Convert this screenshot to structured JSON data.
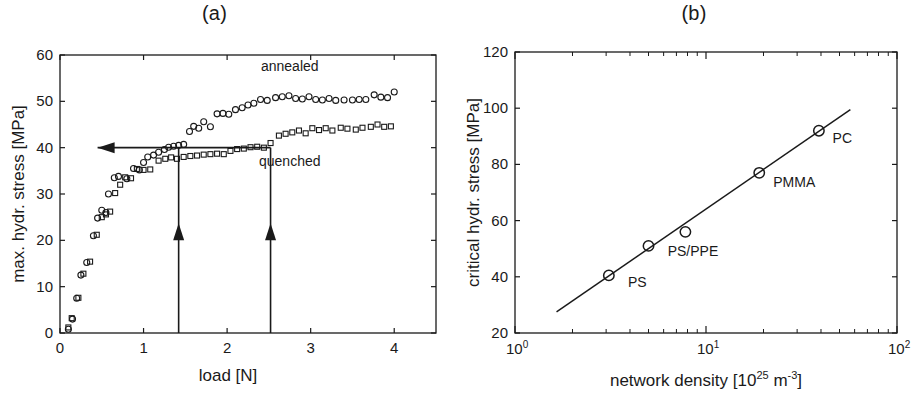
{
  "figure": {
    "background": "#ffffff",
    "ink": "#1a1a1a"
  },
  "panels": {
    "a": {
      "title": "(a)",
      "series_labels": {
        "annealed": "annealed",
        "quenched": "quenched"
      }
    },
    "b": {
      "title": "(b)"
    }
  },
  "chart_data": [
    {
      "panel": "a",
      "type": "scatter",
      "title": "(a)",
      "xlabel": "load [N]",
      "ylabel": "max. hydr. stress [MPa]",
      "xlim": [
        0,
        4.5
      ],
      "ylim": [
        0,
        60
      ],
      "xticks": [
        0,
        1,
        2,
        3,
        4
      ],
      "yticks": [
        0,
        10,
        20,
        30,
        40,
        50,
        60
      ],
      "xtick_labels": [
        "0",
        "1",
        "2",
        "3",
        "4"
      ],
      "ytick_labels": [
        "0",
        "10",
        "20",
        "30",
        "40",
        "50",
        "60"
      ],
      "grid": false,
      "legend_position": "inline-annotation",
      "series": [
        {
          "name": "annealed",
          "marker": "circle",
          "label_text": "annealed",
          "label_x": 2.75,
          "label_y": 56.5,
          "points": [
            [
              0.1,
              0.8
            ],
            [
              0.15,
              3.0
            ],
            [
              0.2,
              7.5
            ],
            [
              0.25,
              12.5
            ],
            [
              0.32,
              15.2
            ],
            [
              0.4,
              21.0
            ],
            [
              0.45,
              24.8
            ],
            [
              0.5,
              26.5
            ],
            [
              0.55,
              26.0
            ],
            [
              0.58,
              30.0
            ],
            [
              0.65,
              33.5
            ],
            [
              0.7,
              33.8
            ],
            [
              0.8,
              33.3
            ],
            [
              0.88,
              35.5
            ],
            [
              0.95,
              35.2
            ],
            [
              1.0,
              36.8
            ],
            [
              1.05,
              38.0
            ],
            [
              1.12,
              38.4
            ],
            [
              1.18,
              39.0
            ],
            [
              1.25,
              39.6
            ],
            [
              1.3,
              40.1
            ],
            [
              1.36,
              40.3
            ],
            [
              1.42,
              40.5
            ],
            [
              1.48,
              40.7
            ],
            [
              1.55,
              43.5
            ],
            [
              1.6,
              44.6
            ],
            [
              1.66,
              44.2
            ],
            [
              1.72,
              45.6
            ],
            [
              1.8,
              44.5
            ],
            [
              1.88,
              47.3
            ],
            [
              1.95,
              47.4
            ],
            [
              2.02,
              47.2
            ],
            [
              2.1,
              48.2
            ],
            [
              2.18,
              48.6
            ],
            [
              2.25,
              49.2
            ],
            [
              2.32,
              49.6
            ],
            [
              2.4,
              50.4
            ],
            [
              2.48,
              50.2
            ],
            [
              2.58,
              50.8
            ],
            [
              2.66,
              51.0
            ],
            [
              2.74,
              51.2
            ],
            [
              2.82,
              50.6
            ],
            [
              2.9,
              50.5
            ],
            [
              2.98,
              51.0
            ],
            [
              3.06,
              50.4
            ],
            [
              3.14,
              50.3
            ],
            [
              3.22,
              50.6
            ],
            [
              3.3,
              50.2
            ],
            [
              3.4,
              50.3
            ],
            [
              3.5,
              50.3
            ],
            [
              3.58,
              50.4
            ],
            [
              3.66,
              50.4
            ],
            [
              3.76,
              51.4
            ],
            [
              3.84,
              50.9
            ],
            [
              3.92,
              50.8
            ],
            [
              4.0,
              52.0
            ]
          ]
        },
        {
          "name": "quenched",
          "marker": "square",
          "label_text": "quenched",
          "label_x": 2.75,
          "label_y": 36.0,
          "points": [
            [
              0.1,
              1.2
            ],
            [
              0.14,
              3.2
            ],
            [
              0.22,
              7.6
            ],
            [
              0.28,
              12.8
            ],
            [
              0.36,
              15.4
            ],
            [
              0.44,
              21.2
            ],
            [
              0.5,
              25.0
            ],
            [
              0.55,
              25.6
            ],
            [
              0.6,
              26.2
            ],
            [
              0.66,
              30.2
            ],
            [
              0.72,
              32.0
            ],
            [
              0.78,
              33.6
            ],
            [
              0.85,
              33.4
            ],
            [
              0.92,
              35.4
            ],
            [
              1.0,
              35.2
            ],
            [
              1.08,
              35.3
            ],
            [
              1.18,
              37.2
            ],
            [
              1.26,
              37.6
            ],
            [
              1.33,
              37.9
            ],
            [
              1.4,
              37.6
            ],
            [
              1.48,
              38.0
            ],
            [
              1.56,
              38.2
            ],
            [
              1.64,
              38.3
            ],
            [
              1.72,
              38.5
            ],
            [
              1.8,
              38.6
            ],
            [
              1.88,
              38.7
            ],
            [
              1.96,
              38.6
            ],
            [
              2.04,
              39.3
            ],
            [
              2.12,
              39.7
            ],
            [
              2.2,
              39.8
            ],
            [
              2.28,
              40.1
            ],
            [
              2.36,
              40.2
            ],
            [
              2.44,
              40.0
            ],
            [
              2.52,
              41.0
            ],
            [
              2.62,
              42.6
            ],
            [
              2.7,
              43.0
            ],
            [
              2.78,
              43.3
            ],
            [
              2.86,
              43.7
            ],
            [
              2.94,
              43.1
            ],
            [
              3.02,
              44.2
            ],
            [
              3.1,
              43.8
            ],
            [
              3.18,
              44.2
            ],
            [
              3.26,
              43.7
            ],
            [
              3.36,
              44.3
            ],
            [
              3.44,
              44.1
            ],
            [
              3.54,
              43.9
            ],
            [
              3.62,
              44.3
            ],
            [
              3.72,
              44.5
            ],
            [
              3.8,
              45.0
            ],
            [
              3.88,
              44.5
            ],
            [
              3.96,
              44.6
            ]
          ]
        }
      ],
      "annotations": [
        {
          "kind": "arrow",
          "name": "critical-stress-level-arrow",
          "from": [
            2.52,
            40.0
          ],
          "to": [
            0.45,
            40.0
          ],
          "direction": "left"
        },
        {
          "kind": "arrow",
          "name": "annealed-load-arrow",
          "from": [
            1.42,
            0.0
          ],
          "to": [
            1.42,
            40.0
          ],
          "direction": "up",
          "head_at": [
            1.42,
            20.0
          ]
        },
        {
          "kind": "arrow",
          "name": "quenched-load-arrow",
          "from": [
            2.52,
            0.0
          ],
          "to": [
            2.52,
            40.0
          ],
          "direction": "up",
          "head_at": [
            2.52,
            20.0
          ]
        }
      ]
    },
    {
      "panel": "b",
      "type": "scatter",
      "title": "(b)",
      "xlabel": "network density [10^25 m^-3]",
      "xlabel_parts": {
        "base": "network density [10",
        "exp": "25",
        "mid": " m",
        "exp2": "-3",
        "close": "]"
      },
      "ylabel": "critical hydr. stress [MPa]",
      "xscale": "log",
      "yscale": "linear",
      "xlim": [
        1,
        100
      ],
      "ylim": [
        20,
        120
      ],
      "xticks": [
        1,
        10,
        100
      ],
      "xtick_labels": [
        "10^0",
        "10^1",
        "10^2"
      ],
      "xtick_label_parts": [
        {
          "base": "10",
          "exp": "0"
        },
        {
          "base": "10",
          "exp": "1"
        },
        {
          "base": "10",
          "exp": "2"
        }
      ],
      "yticks": [
        20,
        40,
        60,
        80,
        100,
        120
      ],
      "ytick_labels": [
        "20",
        "40",
        "60",
        "80",
        "100",
        "120"
      ],
      "grid": false,
      "series": [
        {
          "name": "critical hydrostatic stress vs network density",
          "marker": "circle-large",
          "points": [
            {
              "label": "PS",
              "x": 3.1,
              "y": 40.5
            },
            {
              "label": "PS/PPE",
              "x": 5.0,
              "y": 51.0
            },
            {
              "label": "",
              "x": 7.8,
              "y": 56.0
            },
            {
              "label": "PMMA",
              "x": 19.0,
              "y": 77.0
            },
            {
              "label": "PC",
              "x": 39.0,
              "y": 92.0
            }
          ],
          "point_labels": [
            {
              "text": "PS",
              "x": 3.9,
              "y": 36.5
            },
            {
              "text": "PS/PPE",
              "x": 6.3,
              "y": 47.5
            },
            {
              "text": "PMMA",
              "x": 22.5,
              "y": 72.0
            },
            {
              "text": "PC",
              "x": 46.0,
              "y": 87.5
            }
          ]
        }
      ],
      "fit_line": {
        "name": "power-law-fit",
        "from": {
          "x": 1.65,
          "y": 27.5
        },
        "to": {
          "x": 57.0,
          "y": 99.5
        }
      }
    }
  ]
}
